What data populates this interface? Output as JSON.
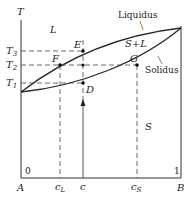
{
  "diagram": {
    "axis_y_label": "T",
    "axis_x_left": "A",
    "axis_x_right": "B",
    "x_min_label": "0",
    "x_max_label": "1",
    "x_ticks": [
      {
        "id": "cL",
        "label": "c",
        "sub": "L"
      },
      {
        "id": "c",
        "label": "c",
        "sub": ""
      },
      {
        "id": "cS",
        "label": "c",
        "sub": "S"
      }
    ],
    "temps": [
      {
        "id": "T3",
        "label": "T",
        "sub": "3"
      },
      {
        "id": "T2",
        "label": "T",
        "sub": "2"
      },
      {
        "id": "T1",
        "label": "T",
        "sub": "1"
      }
    ],
    "points": {
      "E": "E",
      "F": "F",
      "G": "G",
      "D": "D"
    },
    "regions": {
      "liquid": "L",
      "two_phase": "S+L",
      "solid": "S"
    },
    "curves": {
      "liquidus": "Liquidus",
      "solidus": "Solidus"
    },
    "colors": {
      "line": "#2a2a2a",
      "dash": "#444444",
      "arrow": "#b07a3a"
    }
  }
}
